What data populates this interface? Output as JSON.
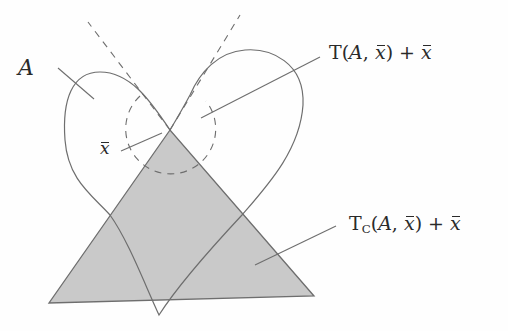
{
  "figure": {
    "type": "tangent-cone-illustration",
    "colors": {
      "background": "#fefefe",
      "stroke": "#6e6e6e",
      "cone_fill": "#c9c9c9",
      "text": "#2a2a2a"
    },
    "labels": {
      "set": {
        "symbol": "A"
      },
      "point": {
        "symbol": "x",
        "accent": "bar"
      },
      "tangent_cone": {
        "prefix": "T(",
        "set": "A",
        "sep": ", ",
        "point": "x",
        "suffix": ") + ",
        "point2": "x"
      },
      "clarke_cone": {
        "prefix": "T",
        "subscript": "C",
        "open": "(",
        "set": "A",
        "sep": ", ",
        "point": "x",
        "suffix": ") + ",
        "point2": "x"
      }
    },
    "geometry": {
      "apex": [
        170,
        130
      ],
      "triangle": [
        [
          170,
          130
        ],
        [
          49,
          303
        ],
        [
          314,
          296
        ]
      ],
      "v_bottom": [
        159,
        315
      ],
      "dashed_tangent_left_end": [
        88,
        22
      ],
      "dashed_tangent_right_end": [
        240,
        15
      ]
    }
  }
}
